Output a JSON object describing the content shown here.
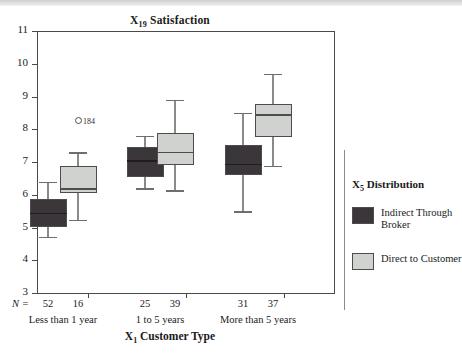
{
  "chart_data": {
    "type": "box",
    "title": "X19 Satisfaction",
    "title_var": "X",
    "title_sub": "19",
    "title_rest": " Satisfaction",
    "xlabel_var": "X",
    "xlabel_sub": "1",
    "xlabel_rest": " Customer Type",
    "ylabel": "",
    "ylim": [
      3,
      11
    ],
    "yticks": [
      11,
      10,
      9,
      8,
      7,
      6,
      5,
      4,
      3
    ],
    "grid": false,
    "n_prefix": "N =",
    "categories": [
      "Less than 1 year",
      "1 to 5 years",
      "More than 5 years"
    ],
    "legend": {
      "title_var": "X",
      "title_sub": "5",
      "title_rest": " Distribution",
      "position": "right",
      "entries": [
        {
          "label": "Indirect Through Broker",
          "color": "#3a3639"
        },
        {
          "label": "Direct to Customer",
          "color": "#cfd2cf"
        }
      ]
    },
    "series": [
      {
        "name": "Indirect Through Broker",
        "color": "#3a3639",
        "boxes": [
          {
            "category": "Less than 1 year",
            "n": 52,
            "whisker_low": 4.72,
            "q1": 5.03,
            "median": 5.45,
            "q3": 5.87,
            "whisker_high": 6.4,
            "outliers": []
          },
          {
            "category": "1 to 5 years",
            "n": 25,
            "whisker_low": 6.2,
            "q1": 6.55,
            "median": 7.05,
            "q3": 7.47,
            "whisker_high": 7.8,
            "outliers": []
          },
          {
            "category": "More than 5 years",
            "n": 31,
            "whisker_low": 5.49,
            "q1": 6.6,
            "median": 6.95,
            "q3": 7.52,
            "whisker_high": 8.5,
            "outliers": []
          }
        ]
      },
      {
        "name": "Direct to Customer",
        "color": "#cfd2cf",
        "boxes": [
          {
            "category": "Less than 1 year",
            "n": 16,
            "whisker_low": 5.24,
            "q1": 6.05,
            "median": 6.2,
            "q3": 6.88,
            "whisker_high": 7.3,
            "outliers": [
              {
                "value": 8.26,
                "label": "184"
              }
            ]
          },
          {
            "category": "1 to 5 years",
            "n": 39,
            "whisker_low": 6.14,
            "q1": 6.9,
            "median": 7.32,
            "q3": 7.9,
            "whisker_high": 8.9,
            "outliers": []
          },
          {
            "category": "More than 5 years",
            "n": 37,
            "whisker_low": 6.88,
            "q1": 7.75,
            "median": 8.46,
            "q3": 8.76,
            "whisker_high": 9.7,
            "outliers": []
          }
        ]
      }
    ],
    "n_row": [
      52,
      16,
      25,
      39,
      31,
      37
    ]
  }
}
